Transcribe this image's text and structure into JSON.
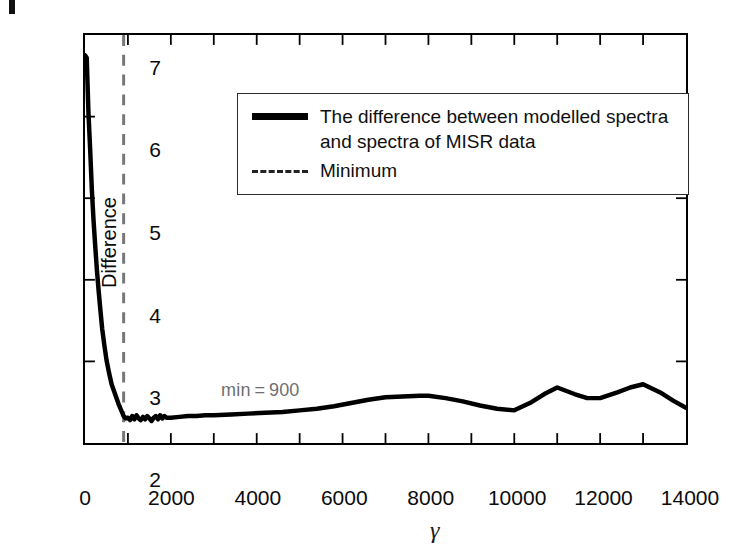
{
  "figure": {
    "artifact_mark": "page-edge-mark"
  },
  "axes": {
    "y_label": "Difference",
    "x_label": "γ",
    "y_ticks": [
      "7",
      "6",
      "5",
      "4",
      "3",
      "2"
    ],
    "y_tick_values": [
      7,
      6,
      5,
      4,
      3,
      2
    ],
    "x_ticks": [
      "0",
      "2000",
      "4000",
      "6000",
      "8000",
      "10000",
      "12000",
      "14000"
    ],
    "x_tick_values": [
      0,
      2000,
      4000,
      6000,
      8000,
      10000,
      12000,
      14000
    ],
    "x_minor_tick_step": 1000
  },
  "legend": {
    "entries": [
      {
        "style": "solid",
        "label": "The difference between modelled spectra\nand spectra of MISR data"
      },
      {
        "style": "dashed",
        "label": "Minimum"
      }
    ]
  },
  "annotation": {
    "min_label": "min = 900",
    "min_value": 900,
    "color": "#6e6e6e"
  },
  "colors": {
    "curve": "#000000",
    "minimum_line": "#777777",
    "axis": "#000000",
    "annotation": "#6e6e6e",
    "background": "#ffffff"
  },
  "chart_data": {
    "type": "line",
    "title": "",
    "xlabel": "γ",
    "ylabel": "Difference",
    "xlim": [
      0,
      14000
    ],
    "ylim": [
      2,
      7
    ],
    "grid": false,
    "legend_position": "upper-center",
    "series": [
      {
        "name": "The difference between modelled spectra and spectra of MISR data",
        "style": "solid",
        "color": "#000000",
        "x": [
          0,
          40,
          80,
          120,
          160,
          200,
          240,
          280,
          320,
          360,
          400,
          450,
          500,
          560,
          620,
          700,
          780,
          860,
          900,
          950,
          1000,
          1050,
          1100,
          1150,
          1200,
          1250,
          1300,
          1350,
          1400,
          1450,
          1500,
          1550,
          1600,
          1650,
          1700,
          1750,
          1800,
          1850,
          1900,
          2000,
          2200,
          2400,
          2600,
          2800,
          3000,
          3400,
          3800,
          4200,
          4600,
          5000,
          5400,
          5800,
          6200,
          6600,
          7000,
          7400,
          7800,
          8000,
          8400,
          8800,
          9200,
          9600,
          10000,
          10400,
          10700,
          11000,
          11400,
          11700,
          12000,
          12400,
          12700,
          13000,
          13400,
          13700,
          14000
        ],
        "y": [
          6.75,
          6.72,
          6.05,
          5.6,
          5.1,
          4.72,
          4.4,
          4.1,
          3.85,
          3.62,
          3.4,
          3.2,
          3.02,
          2.86,
          2.72,
          2.6,
          2.48,
          2.38,
          2.33,
          2.3,
          2.31,
          2.28,
          2.33,
          2.29,
          2.34,
          2.3,
          2.28,
          2.32,
          2.29,
          2.33,
          2.3,
          2.27,
          2.31,
          2.33,
          2.29,
          2.34,
          2.3,
          2.33,
          2.31,
          2.31,
          2.32,
          2.33,
          2.33,
          2.34,
          2.34,
          2.35,
          2.36,
          2.37,
          2.38,
          2.4,
          2.42,
          2.45,
          2.49,
          2.53,
          2.56,
          2.57,
          2.58,
          2.58,
          2.55,
          2.51,
          2.46,
          2.42,
          2.4,
          2.5,
          2.6,
          2.68,
          2.6,
          2.55,
          2.55,
          2.62,
          2.68,
          2.72,
          2.62,
          2.52,
          2.43
        ]
      },
      {
        "name": "Minimum",
        "style": "dashed",
        "color": "#777777",
        "type": "vline",
        "x": 900
      }
    ]
  }
}
